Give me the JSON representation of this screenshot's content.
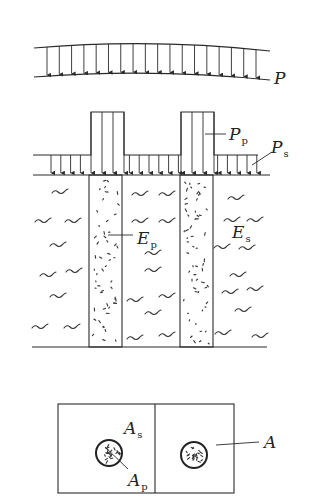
{
  "figure": {
    "panel_uniform_load": {
      "label": "P",
      "arrow_count": 18
    },
    "panel_composite_foundation": {
      "pile_load_label": "P",
      "pile_load_sub": "p",
      "soil_load_label": "P",
      "soil_load_sub": "s",
      "pile_modulus_label": "E",
      "pile_modulus_sub": "p",
      "soil_modulus_label": "E",
      "soil_modulus_sub": "s",
      "pile_count": 2
    },
    "panel_plan_view": {
      "soil_area_label": "A",
      "soil_area_sub": "s",
      "pile_area_label": "A",
      "pile_area_sub": "p",
      "unit_area_label": "A",
      "cell_count": 2
    }
  },
  "colors": {
    "line": "#2a2a2a",
    "background": "#ffffff"
  }
}
